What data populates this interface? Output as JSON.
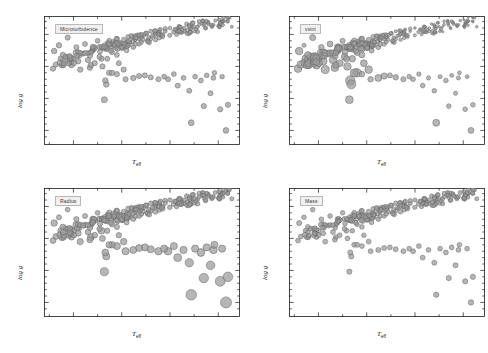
{
  "figure": {
    "type": "scatter-grid",
    "background_color": "#ffffff",
    "marker_fill": "#9a9a9a",
    "marker_stroke": "#6b6b6b",
    "axis_color": "#1a1a1a",
    "label_box_fill": "#f0f0f0",
    "label_box_stroke": "#b8b8b8"
  },
  "axes": {
    "xlabel_main": "T",
    "xlabel_sub": "eff",
    "ylabel": "log g",
    "xticks": [
      "6500",
      "6000",
      "5500",
      "5000"
    ],
    "xtick_values": [
      6500,
      6000,
      5500,
      5000
    ],
    "yticks": [
      "3.0",
      "3.5",
      "4.0",
      "4.5"
    ],
    "ytick_values": [
      3.0,
      3.5,
      4.0,
      4.5
    ],
    "xlim": [
      6800,
      4780
    ],
    "ylim": [
      4.78,
      2.78
    ],
    "x_inverted": true,
    "y_inverted": true,
    "minor_ticks": true,
    "ticks_direction": "inward",
    "ticks_all_sides": true,
    "grid": false
  },
  "panels": [
    {
      "label": "Microturbulence",
      "size_metric": "microturbulence",
      "position": "top-left"
    },
    {
      "label": "vsini",
      "size_metric": "rotational velocity v sin i",
      "position": "top-right"
    },
    {
      "label": "Radius",
      "size_metric": "stellar radius",
      "position": "bottom-left"
    },
    {
      "label": "Mass",
      "size_metric": "stellar mass",
      "position": "bottom-right"
    }
  ],
  "chart_data": {
    "type": "scatter",
    "title": "",
    "xlabel": "T_eff",
    "ylabel": "log g",
    "xlim": [
      6800,
      4780
    ],
    "ylim": [
      4.78,
      2.78
    ],
    "grid": false,
    "legend": "none",
    "size_encodes_panel_metric": true,
    "panel_labels": [
      "Microturbulence",
      "vsini",
      "Radius",
      "Mass"
    ],
    "stars": [
      {
        "teff": 6650,
        "logg": 4.33,
        "micro": 2.0,
        "vsini": 0.6,
        "radius": 1.1,
        "mass": 1.1
      },
      {
        "teff": 6610,
        "logg": 4.18,
        "micro": 1.9,
        "vsini": 1.8,
        "radius": 1.4,
        "mass": 1.2
      },
      {
        "teff": 6560,
        "logg": 4.45,
        "micro": 1.7,
        "vsini": 1.5,
        "radius": 1.0,
        "mass": 1.1
      },
      {
        "teff": 6520,
        "logg": 4.02,
        "micro": 2.1,
        "vsini": 2.6,
        "radius": 1.6,
        "mass": 1.3
      },
      {
        "teff": 6500,
        "logg": 4.12,
        "micro": 1.9,
        "vsini": 2.2,
        "radius": 1.5,
        "mass": 1.2
      },
      {
        "teff": 6470,
        "logg": 4.3,
        "micro": 1.6,
        "vsini": 1.2,
        "radius": 1.2,
        "mass": 1.1
      },
      {
        "teff": 6450,
        "logg": 4.08,
        "micro": 1.8,
        "vsini": 2.4,
        "radius": 1.5,
        "mass": 1.2
      },
      {
        "teff": 6430,
        "logg": 3.95,
        "micro": 2.0,
        "vsini": 2.8,
        "radius": 1.8,
        "mass": 1.3
      },
      {
        "teff": 6400,
        "logg": 4.2,
        "micro": 1.7,
        "vsini": 2.0,
        "radius": 1.3,
        "mass": 1.2
      },
      {
        "teff": 6380,
        "logg": 4.35,
        "micro": 1.5,
        "vsini": 1.4,
        "radius": 1.1,
        "mass": 1.1
      },
      {
        "teff": 6350,
        "logg": 4.1,
        "micro": 1.8,
        "vsini": 2.3,
        "radius": 1.4,
        "mass": 1.2
      },
      {
        "teff": 6330,
        "logg": 3.98,
        "micro": 1.9,
        "vsini": 2.5,
        "radius": 1.7,
        "mass": 1.3
      },
      {
        "teff": 6300,
        "logg": 4.25,
        "micro": 1.6,
        "vsini": 1.7,
        "radius": 1.2,
        "mass": 1.1
      },
      {
        "teff": 6280,
        "logg": 4.05,
        "micro": 1.8,
        "vsini": 2.1,
        "radius": 1.5,
        "mass": 1.2
      },
      {
        "teff": 6250,
        "logg": 4.4,
        "micro": 1.4,
        "vsini": 1.0,
        "radius": 1.0,
        "mass": 1.0
      },
      {
        "teff": 6230,
        "logg": 4.15,
        "micro": 1.7,
        "vsini": 1.9,
        "radius": 1.3,
        "mass": 1.1
      },
      {
        "teff": 6200,
        "logg": 4.0,
        "micro": 1.8,
        "vsini": 2.4,
        "radius": 1.6,
        "mass": 1.2
      },
      {
        "teff": 6180,
        "logg": 4.28,
        "micro": 1.5,
        "vsini": 1.5,
        "radius": 1.1,
        "mass": 1.1
      },
      {
        "teff": 6150,
        "logg": 4.12,
        "micro": 1.6,
        "vsini": 1.8,
        "radius": 1.3,
        "mass": 1.1
      },
      {
        "teff": 6130,
        "logg": 3.9,
        "micro": 1.9,
        "vsini": 2.7,
        "radius": 1.9,
        "mass": 1.3
      },
      {
        "teff": 6100,
        "logg": 4.22,
        "micro": 1.5,
        "vsini": 1.6,
        "radius": 1.2,
        "mass": 1.1
      },
      {
        "teff": 6080,
        "logg": 4.35,
        "micro": 1.3,
        "vsini": 1.1,
        "radius": 1.0,
        "mass": 1.0
      },
      {
        "teff": 6050,
        "logg": 4.18,
        "micro": 1.5,
        "vsini": 1.4,
        "radius": 1.2,
        "mass": 1.1
      },
      {
        "teff": 6030,
        "logg": 4.05,
        "micro": 1.6,
        "vsini": 1.9,
        "radius": 1.4,
        "mass": 1.1
      },
      {
        "teff": 6000,
        "logg": 4.3,
        "micro": 1.3,
        "vsini": 1.2,
        "radius": 1.1,
        "mass": 1.0
      },
      {
        "teff": 5980,
        "logg": 4.42,
        "micro": 1.2,
        "vsini": 0.8,
        "radius": 0.9,
        "mass": 1.0
      },
      {
        "teff": 5950,
        "logg": 4.25,
        "micro": 1.3,
        "vsini": 1.0,
        "radius": 1.1,
        "mass": 1.0
      },
      {
        "teff": 5920,
        "logg": 4.38,
        "micro": 1.2,
        "vsini": 0.7,
        "radius": 1.0,
        "mass": 1.0
      },
      {
        "teff": 5900,
        "logg": 4.48,
        "micro": 1.1,
        "vsini": 0.6,
        "radius": 0.9,
        "mass": 0.9
      },
      {
        "teff": 5880,
        "logg": 4.3,
        "micro": 1.2,
        "vsini": 0.9,
        "radius": 1.0,
        "mass": 1.0
      },
      {
        "teff": 5850,
        "logg": 4.45,
        "micro": 1.1,
        "vsini": 0.5,
        "radius": 0.9,
        "mass": 0.9
      },
      {
        "teff": 5820,
        "logg": 4.35,
        "micro": 1.1,
        "vsini": 0.7,
        "radius": 1.0,
        "mass": 1.0
      },
      {
        "teff": 5800,
        "logg": 4.5,
        "micro": 1.0,
        "vsini": 0.4,
        "radius": 0.9,
        "mass": 0.9
      },
      {
        "teff": 5780,
        "logg": 4.42,
        "micro": 1.0,
        "vsini": 0.5,
        "radius": 0.9,
        "mass": 1.0
      },
      {
        "teff": 5750,
        "logg": 4.52,
        "micro": 1.0,
        "vsini": 0.4,
        "radius": 0.9,
        "mass": 0.9
      },
      {
        "teff": 5720,
        "logg": 4.45,
        "micro": 0.9,
        "vsini": 0.4,
        "radius": 0.9,
        "mass": 0.9
      },
      {
        "teff": 5700,
        "logg": 4.55,
        "micro": 0.9,
        "vsini": 0.3,
        "radius": 0.8,
        "mass": 0.9
      },
      {
        "teff": 5680,
        "logg": 4.48,
        "micro": 0.9,
        "vsini": 0.4,
        "radius": 0.9,
        "mass": 0.9
      },
      {
        "teff": 5650,
        "logg": 4.56,
        "micro": 0.8,
        "vsini": 0.3,
        "radius": 0.8,
        "mass": 0.9
      },
      {
        "teff": 5620,
        "logg": 4.5,
        "micro": 0.9,
        "vsini": 0.3,
        "radius": 0.8,
        "mass": 0.9
      },
      {
        "teff": 5600,
        "logg": 4.58,
        "micro": 0.8,
        "vsini": 0.2,
        "radius": 0.8,
        "mass": 0.9
      },
      {
        "teff": 5550,
        "logg": 4.55,
        "micro": 0.8,
        "vsini": 0.2,
        "radius": 0.8,
        "mass": 0.9
      },
      {
        "teff": 5500,
        "logg": 4.6,
        "micro": 0.7,
        "vsini": 0.2,
        "radius": 0.8,
        "mass": 0.8
      },
      {
        "teff": 5450,
        "logg": 4.58,
        "micro": 0.7,
        "vsini": 0.2,
        "radius": 0.8,
        "mass": 0.8
      },
      {
        "teff": 5400,
        "logg": 4.62,
        "micro": 0.7,
        "vsini": 0.2,
        "radius": 0.8,
        "mass": 0.8
      },
      {
        "teff": 5350,
        "logg": 4.6,
        "micro": 0.6,
        "vsini": 0.2,
        "radius": 0.7,
        "mass": 0.8
      },
      {
        "teff": 5300,
        "logg": 4.63,
        "micro": 0.6,
        "vsini": 0.2,
        "radius": 0.7,
        "mass": 0.8
      },
      {
        "teff": 5250,
        "logg": 4.62,
        "micro": 0.6,
        "vsini": 0.2,
        "radius": 0.7,
        "mass": 0.8
      },
      {
        "teff": 5200,
        "logg": 4.65,
        "micro": 0.5,
        "vsini": 0.2,
        "radius": 0.7,
        "mass": 0.8
      },
      {
        "teff": 5150,
        "logg": 4.64,
        "micro": 0.5,
        "vsini": 0.2,
        "radius": 0.7,
        "mass": 0.7
      },
      {
        "teff": 5100,
        "logg": 4.66,
        "micro": 0.5,
        "vsini": 0.2,
        "radius": 0.7,
        "mass": 0.7
      },
      {
        "teff": 5050,
        "logg": 4.65,
        "micro": 0.5,
        "vsini": 0.2,
        "radius": 0.7,
        "mass": 0.7
      },
      {
        "teff": 4980,
        "logg": 4.68,
        "micro": 0.4,
        "vsini": 0.2,
        "radius": 0.7,
        "mass": 0.7
      },
      {
        "teff": 4900,
        "logg": 4.7,
        "micro": 0.4,
        "vsini": 0.2,
        "radius": 0.6,
        "mass": 0.7
      },
      {
        "teff": 6180,
        "logg": 3.48,
        "micro": 2.6,
        "vsini": 2.6,
        "radius": 3.2,
        "mass": 1.5
      },
      {
        "teff": 6170,
        "logg": 3.78,
        "micro": 2.0,
        "vsini": 4.0,
        "radius": 2.2,
        "mass": 1.4
      },
      {
        "teff": 6160,
        "logg": 3.72,
        "micro": 2.2,
        "vsini": 3.6,
        "radius": 2.4,
        "mass": 1.5
      },
      {
        "teff": 6100,
        "logg": 3.9,
        "micro": 1.9,
        "vsini": 3.2,
        "radius": 2.0,
        "mass": 1.3
      },
      {
        "teff": 5980,
        "logg": 3.95,
        "micro": 1.8,
        "vsini": 2.4,
        "radius": 2.0,
        "mass": 1.3
      },
      {
        "teff": 5880,
        "logg": 3.82,
        "micro": 1.9,
        "vsini": 2.0,
        "radius": 2.3,
        "mass": 1.4
      },
      {
        "teff": 5820,
        "logg": 3.85,
        "micro": 1.8,
        "vsini": 1.6,
        "radius": 2.2,
        "mass": 1.3
      },
      {
        "teff": 5700,
        "logg": 3.83,
        "micro": 1.7,
        "vsini": 1.2,
        "radius": 2.4,
        "mass": 1.3
      },
      {
        "teff": 5620,
        "logg": 3.8,
        "micro": 1.6,
        "vsini": 1.0,
        "radius": 2.6,
        "mass": 1.3
      },
      {
        "teff": 5520,
        "logg": 3.8,
        "micro": 1.6,
        "vsini": 0.8,
        "radius": 2.8,
        "mass": 1.3
      },
      {
        "teff": 5420,
        "logg": 3.7,
        "micro": 1.6,
        "vsini": 0.8,
        "radius": 3.0,
        "mass": 1.3
      },
      {
        "teff": 5300,
        "logg": 3.62,
        "micro": 1.6,
        "vsini": 0.8,
        "radius": 3.4,
        "mass": 1.4
      },
      {
        "teff": 5280,
        "logg": 3.12,
        "micro": 2.4,
        "vsini": 2.0,
        "radius": 5.6,
        "mass": 1.6
      },
      {
        "teff": 5180,
        "logg": 3.78,
        "micro": 1.5,
        "vsini": 0.8,
        "radius": 3.0,
        "mass": 1.3
      },
      {
        "teff": 5150,
        "logg": 3.38,
        "micro": 1.8,
        "vsini": 0.8,
        "radius": 4.4,
        "mass": 1.5
      },
      {
        "teff": 5080,
        "logg": 3.58,
        "micro": 1.6,
        "vsini": 0.6,
        "radius": 3.6,
        "mass": 1.4
      },
      {
        "teff": 5050,
        "logg": 3.82,
        "micro": 1.4,
        "vsini": 0.6,
        "radius": 2.8,
        "mass": 1.2
      },
      {
        "teff": 4980,
        "logg": 3.33,
        "micro": 1.8,
        "vsini": 0.8,
        "radius": 4.8,
        "mass": 1.5
      },
      {
        "teff": 4920,
        "logg": 3.0,
        "micro": 2.2,
        "vsini": 1.4,
        "radius": 6.2,
        "mass": 1.7
      },
      {
        "teff": 4900,
        "logg": 3.4,
        "micro": 1.7,
        "vsini": 0.8,
        "radius": 4.6,
        "mass": 1.5
      },
      {
        "teff": 4860,
        "logg": 4.62,
        "micro": 0.4,
        "vsini": 0.2,
        "radius": 0.7,
        "mass": 0.7
      }
    ]
  }
}
